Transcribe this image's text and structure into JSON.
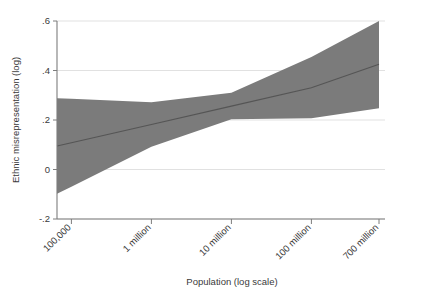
{
  "chart_data": {
    "type": "area",
    "title": "",
    "subtitle": "",
    "xlabel": "Population (log scale)",
    "ylabel": "Ethnic misrepresentation (log)",
    "x_scale": "log",
    "grid": true,
    "legend": "none",
    "xlim_log10": [
      4.82,
      8.845
    ],
    "ylim": [
      -0.2,
      0.6
    ],
    "x_ticks": [
      {
        "label": "100,000",
        "value": 100000,
        "log10": 5.0
      },
      {
        "label": "1 million",
        "value": 1000000,
        "log10": 6.0
      },
      {
        "label": "10 million",
        "value": 10000000,
        "log10": 7.0
      },
      {
        "label": "100 million",
        "value": 100000000,
        "log10": 8.0
      },
      {
        "label": "700 million",
        "value": 700000000,
        "log10": 8.845
      }
    ],
    "y_ticks": [
      {
        "label": ".6",
        "value": 0.6
      },
      {
        "label": ".4",
        "value": 0.4
      },
      {
        "label": ".2",
        "value": 0.2
      },
      {
        "label": "0",
        "value": 0
      },
      {
        "label": "-.2",
        "value": -0.2
      }
    ],
    "series": [
      {
        "name": "Predicted ethnic misrepresentation (log)",
        "type": "line",
        "color": "#555555",
        "x_log10": [
          4.82,
          5.0,
          6.0,
          7.0,
          8.0,
          8.845
        ],
        "values": [
          0.095,
          0.108,
          0.182,
          0.256,
          0.33,
          0.425
        ]
      },
      {
        "name": "95% confidence interval",
        "type": "band",
        "color": "#7b7b7b",
        "x_log10": [
          4.82,
          5.0,
          6.0,
          7.0,
          8.0,
          8.845
        ],
        "upper": [
          0.288,
          0.286,
          0.272,
          0.31,
          0.455,
          0.6
        ],
        "lower": [
          -0.098,
          -0.07,
          0.092,
          0.203,
          0.207,
          0.247
        ]
      }
    ],
    "colors": {
      "band": "#7b7b7b",
      "fit_line": "#555555",
      "gridline": "#d9d9d9",
      "axis": "#7d7d7d",
      "text": "#3a3a3a",
      "background": "#ffffff"
    }
  }
}
